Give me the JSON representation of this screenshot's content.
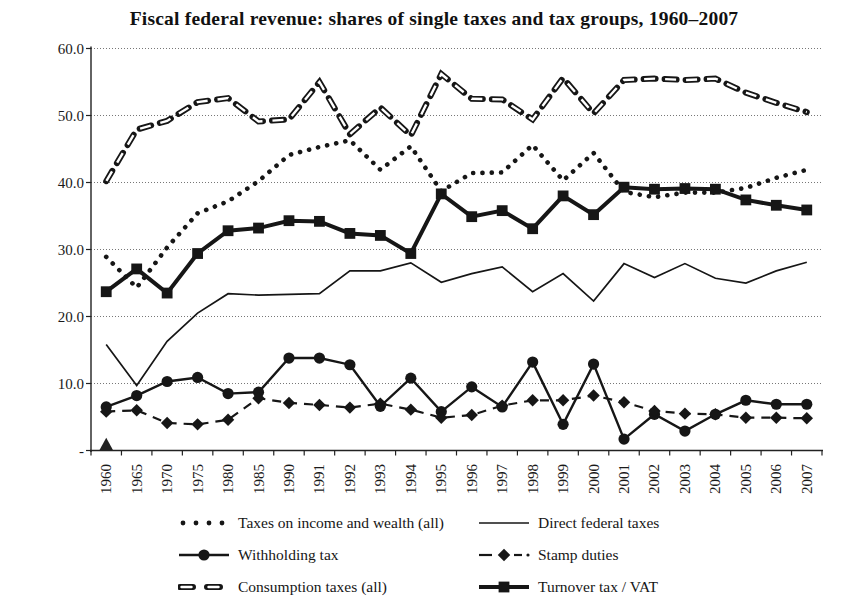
{
  "title": "Fiscal federal revenue: shares of single taxes and tax groups, 1960–2007",
  "y_axis": {
    "tick_labels": [
      "60.0",
      "50.0",
      "40.0",
      "30.0",
      "20.0",
      "10.0",
      "-"
    ],
    "tick_values": [
      60,
      50,
      40,
      30,
      20,
      10,
      0
    ]
  },
  "chart_data": {
    "type": "line",
    "title": "Fiscal federal revenue: shares of single taxes and tax groups, 1960–2007",
    "xlabel": "",
    "ylabel": "",
    "ylim": [
      0,
      60
    ],
    "yticks": [
      0,
      10,
      20,
      30,
      40,
      50,
      60
    ],
    "grid": "horizontal-dotted",
    "legend_position": "bottom",
    "ink_color": "#161616",
    "categories": [
      "1960",
      "1965",
      "1970",
      "1975",
      "1980",
      "1985",
      "1990",
      "1991",
      "1992",
      "1993",
      "1994",
      "1995",
      "1996",
      "1997",
      "1998",
      "1999",
      "2000",
      "2001",
      "2002",
      "2003",
      "2004",
      "2005",
      "2006",
      "2007"
    ],
    "series": [
      {
        "name": "Taxes on income and wealth (all)",
        "style": "dotted",
        "values": [
          28.9,
          24.3,
          30.3,
          35.4,
          37.2,
          40.2,
          44.1,
          45.3,
          46.3,
          41.9,
          45.4,
          38.7,
          41.4,
          41.5,
          45.6,
          40.3,
          44.4,
          38.6,
          37.8,
          38.5,
          38.5,
          39.2,
          40.7,
          41.9
        ]
      },
      {
        "name": "Direct federal taxes",
        "style": "thin-solid",
        "values": [
          15.8,
          9.7,
          16.3,
          20.5,
          23.4,
          23.2,
          23.3,
          23.4,
          26.8,
          26.8,
          28.0,
          25.1,
          26.4,
          27.4,
          23.7,
          26.4,
          22.3,
          27.9,
          25.8,
          27.9,
          25.7,
          25.0,
          26.8,
          28.1
        ]
      },
      {
        "name": "Withholding tax",
        "style": "solid-circle",
        "values": [
          6.5,
          8.2,
          10.3,
          10.9,
          8.5,
          8.7,
          13.8,
          13.8,
          12.8,
          6.6,
          10.8,
          5.8,
          9.5,
          6.5,
          13.2,
          3.9,
          12.9,
          1.7,
          5.4,
          2.9,
          5.4,
          7.5,
          6.9,
          6.9
        ]
      },
      {
        "name": "Stamp duties",
        "style": "dash-diamond",
        "values": [
          5.8,
          6.0,
          4.1,
          3.9,
          4.6,
          7.8,
          7.1,
          6.8,
          6.4,
          7.0,
          6.1,
          4.9,
          5.3,
          6.7,
          7.5,
          7.5,
          8.2,
          7.2,
          5.9,
          5.5,
          5.4,
          4.9,
          4.9,
          4.8
        ]
      },
      {
        "name": "Consumption taxes (all)",
        "style": "thick-dash-hollow",
        "values": [
          40.2,
          47.9,
          49.2,
          52.0,
          52.6,
          49.1,
          49.4,
          55.0,
          47.2,
          51.2,
          47.0,
          56.2,
          52.5,
          52.4,
          49.4,
          55.6,
          50.3,
          55.3,
          55.5,
          55.3,
          55.5,
          53.4,
          51.9,
          50.5
        ]
      },
      {
        "name": "Turnover tax / VAT",
        "style": "thick-solid-square",
        "values": [
          23.7,
          27.1,
          23.5,
          29.4,
          32.8,
          33.2,
          34.3,
          34.2,
          32.4,
          32.1,
          29.4,
          38.3,
          34.9,
          35.8,
          33.1,
          38.0,
          35.2,
          39.3,
          39.0,
          39.1,
          39.0,
          37.4,
          36.6,
          35.9
        ]
      }
    ],
    "annotations": [
      {
        "shape": "triangle-marker",
        "category": "1960",
        "base_value": 0,
        "peak_value": 1.9
      }
    ]
  },
  "legend": {
    "row_order": [
      0,
      1,
      2,
      3,
      4,
      5
    ]
  }
}
